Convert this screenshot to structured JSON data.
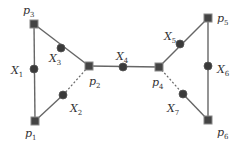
{
  "diagram": {
    "colors": {
      "edge": "#666666",
      "node_square": "#444444",
      "node_square_border": "#888888",
      "node_circle": "#3a3a3a",
      "label": "#333333"
    },
    "squares": [
      {
        "id": "p1",
        "base": "p",
        "sub": "1",
        "x": 35,
        "y": 121,
        "lx": 25,
        "ly": 137
      },
      {
        "id": "p2",
        "base": "p",
        "sub": "2",
        "x": 89,
        "y": 66,
        "lx": 89,
        "ly": 85
      },
      {
        "id": "p3",
        "base": "p",
        "sub": "3",
        "x": 34,
        "y": 24,
        "lx": 23,
        "ly": 14
      },
      {
        "id": "p4",
        "base": "p",
        "sub": "4",
        "x": 159,
        "y": 67,
        "lx": 152,
        "ly": 86
      },
      {
        "id": "p5",
        "base": "p",
        "sub": "5",
        "x": 208,
        "y": 18,
        "lx": 217,
        "ly": 22
      },
      {
        "id": "p6",
        "base": "p",
        "sub": "6",
        "x": 208,
        "y": 120,
        "lx": 217,
        "ly": 136
      }
    ],
    "circles": [
      {
        "id": "X1",
        "base": "X",
        "sub": "1",
        "x": 34,
        "y": 69,
        "lx": 11,
        "ly": 74
      },
      {
        "id": "X2",
        "base": "X",
        "sub": "2",
        "x": 63,
        "y": 95,
        "lx": 70,
        "ly": 112
      },
      {
        "id": "X3",
        "base": "X",
        "sub": "3",
        "x": 61,
        "y": 48,
        "lx": 49,
        "ly": 62
      },
      {
        "id": "X4",
        "base": "X",
        "sub": "4",
        "x": 123,
        "y": 67,
        "lx": 116,
        "ly": 60
      },
      {
        "id": "X5",
        "base": "X",
        "sub": "5",
        "x": 180,
        "y": 44,
        "lx": 164,
        "ly": 40
      },
      {
        "id": "X6",
        "base": "X",
        "sub": "6",
        "x": 208,
        "y": 66,
        "lx": 217,
        "ly": 73
      },
      {
        "id": "X7",
        "base": "X",
        "sub": "7",
        "x": 183,
        "y": 94,
        "lx": 167,
        "ly": 112
      }
    ],
    "edges": [
      {
        "from": "p3",
        "to": "p1",
        "style": "solid"
      },
      {
        "from": "p3",
        "to": "p2",
        "style": "solid"
      },
      {
        "from": "p1",
        "to": "X2",
        "style": "solid"
      },
      {
        "from": "X2",
        "to": "p2",
        "style": "dashed"
      },
      {
        "from": "p2",
        "to": "p4",
        "style": "solid"
      },
      {
        "from": "p4",
        "to": "p5",
        "style": "solid"
      },
      {
        "from": "p5",
        "to": "p6",
        "style": "solid"
      },
      {
        "from": "p4",
        "to": "X7",
        "style": "dashed"
      },
      {
        "from": "X7",
        "to": "p6",
        "style": "solid"
      }
    ]
  }
}
